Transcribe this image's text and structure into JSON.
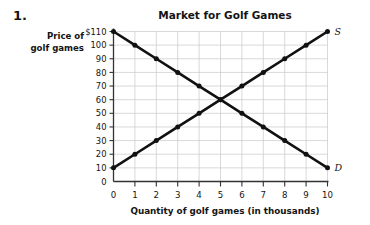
{
  "problem": {
    "number": "1."
  },
  "chart_data": {
    "type": "line",
    "title": "Market for Golf Games",
    "xlabel": "Quantity of golf games (in thousands)",
    "ylabel": "Price of golf games",
    "ylabel_line1": "Price of",
    "ylabel_line2": "golf games",
    "grid": true,
    "legend_position": "inline-endpoint",
    "xlim": [
      0,
      10
    ],
    "ylim": [
      0,
      110
    ],
    "x": [
      0,
      1,
      2,
      3,
      4,
      5,
      6,
      7,
      8,
      9,
      10
    ],
    "xticks": [
      "0",
      "1",
      "2",
      "3",
      "4",
      "5",
      "6",
      "7",
      "8",
      "9",
      "10"
    ],
    "yticks": [
      "$110",
      "100",
      "90",
      "80",
      "70",
      "60",
      "50",
      "40",
      "30",
      "20",
      "10",
      "0"
    ],
    "ytick_values": [
      110,
      100,
      90,
      80,
      70,
      60,
      50,
      40,
      30,
      20,
      10,
      0
    ],
    "series": [
      {
        "name": "Demand",
        "label": "D",
        "values": [
          110,
          100,
          90,
          80,
          70,
          60,
          50,
          40,
          30,
          20,
          10
        ],
        "color": "#111111"
      },
      {
        "name": "Supply",
        "label": "S",
        "values": [
          10,
          20,
          30,
          40,
          50,
          60,
          70,
          80,
          90,
          100,
          110
        ],
        "color": "#111111"
      }
    ],
    "equilibrium": {
      "quantity": 5,
      "price": 60
    },
    "colors": {
      "line": "#111111",
      "grid": "#c8c8c8",
      "axis": "#333333",
      "text": "#141414",
      "background": "#ffffff"
    }
  }
}
